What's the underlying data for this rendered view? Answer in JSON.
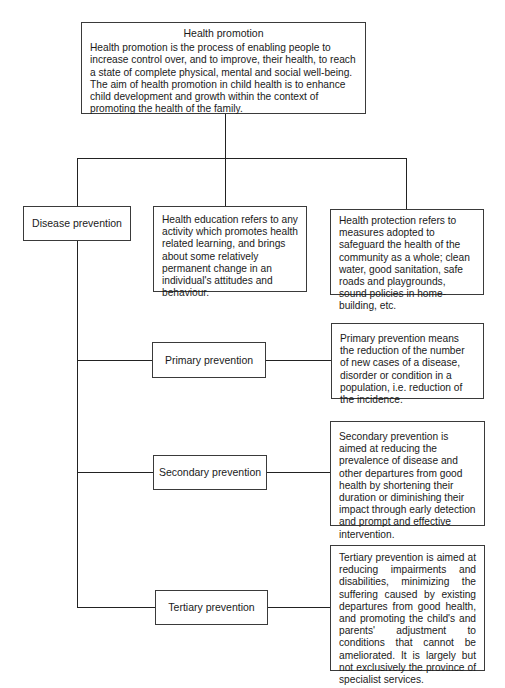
{
  "figure": {
    "top": {
      "title": "Health promotion",
      "text": "Health promotion is the process of enabling people to increase control over, and to improve, their health, to reach a state of complete physical, mental and social well-being. The aim of health promotion in child health is to enhance child development and growth within the context of promoting the health of the family."
    },
    "branches": [
      {
        "label": "Disease prevention"
      },
      {
        "text": "Health education refers to any activity which promotes health related learning, and brings about some relatively permanent change in an individual's attitudes and behaviour."
      },
      {
        "text": "Health protection refers to measures adopted to safeguard the health of the community as a whole; clean water, good sanitation, safe roads and playgrounds, sound policies in home-building, etc."
      }
    ],
    "prevention_levels": [
      {
        "label": "Primary prevention",
        "text": "Primary prevention means the reduction of the number of new cases of a disease, disorder or condition in a population, i.e. reduction of the incidence."
      },
      {
        "label": "Secondary prevention",
        "text": "Secondary prevention is aimed at reducing the prevalence of disease and other departures from good health by shortening their duration or diminishing their impact through early detection and prompt and effective intervention."
      },
      {
        "label": "Tertiary prevention",
        "text": "Tertiary prevention is aimed at reducing impairments and disabilities, minimizing the suffering caused by existing departures from good health, and promoting the child's and parents' adjustment to conditions that cannot be ameliorated. It is largely but not exclusively the province of specialist services."
      }
    ],
    "colors": {
      "line": "#222222",
      "border": "#3a3a3a",
      "text": "#1a1a1a",
      "background": "#ffffff"
    }
  }
}
